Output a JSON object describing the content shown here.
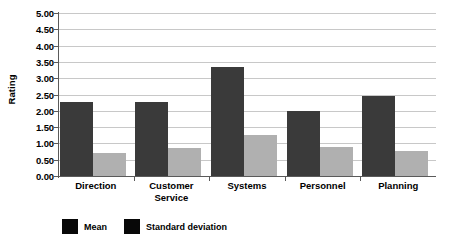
{
  "chart_data": {
    "type": "bar",
    "title": "",
    "xlabel": "",
    "ylabel": "Rating",
    "ylim": [
      0.0,
      5.0
    ],
    "ytick_step": 0.5,
    "grid": true,
    "legend_position": "bottom-left",
    "categories": [
      "Direction",
      "Customer Service",
      "Systems",
      "Personnel",
      "Planning"
    ],
    "series": [
      {
        "name": "Mean",
        "color": "#3a3a3a",
        "values": [
          2.28,
          2.28,
          3.33,
          1.98,
          2.46
        ]
      },
      {
        "name": "Standard deviation",
        "color": "#b0b0b0",
        "values": [
          0.72,
          0.85,
          1.27,
          0.9,
          0.76
        ]
      }
    ],
    "ytick_labels": [
      "0.00",
      "0.50",
      "1.00",
      "1.50",
      "2.00",
      "2.50",
      "3.00",
      "3.50",
      "4.00",
      "4.50",
      "5.00"
    ]
  },
  "legend": {
    "swatch_color": "#080808",
    "entries": [
      {
        "label": "Mean"
      },
      {
        "label": "Standard deviation"
      }
    ]
  },
  "axes": {
    "y_title": "Rating"
  }
}
